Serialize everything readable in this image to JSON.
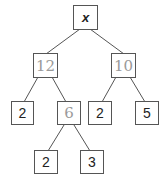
{
  "diagram": {
    "type": "binary-tree",
    "nodes": {
      "root": {
        "label": "x",
        "style": "italic"
      },
      "left": {
        "label": "12",
        "style": "handwritten"
      },
      "right": {
        "label": "10",
        "style": "handwritten"
      },
      "left_left": {
        "label": "2"
      },
      "left_right": {
        "label": "6",
        "style": "handwritten"
      },
      "right_left": {
        "label": "2"
      },
      "right_right": {
        "label": "5"
      },
      "left_right_left": {
        "label": "2"
      },
      "left_right_right": {
        "label": "3"
      }
    },
    "edges": [
      [
        "root",
        "left"
      ],
      [
        "root",
        "right"
      ],
      [
        "left",
        "left_left"
      ],
      [
        "left",
        "left_right"
      ],
      [
        "right",
        "right_left"
      ],
      [
        "right",
        "right_right"
      ],
      [
        "left_right",
        "left_right_left"
      ],
      [
        "left_right",
        "left_right_right"
      ]
    ]
  }
}
